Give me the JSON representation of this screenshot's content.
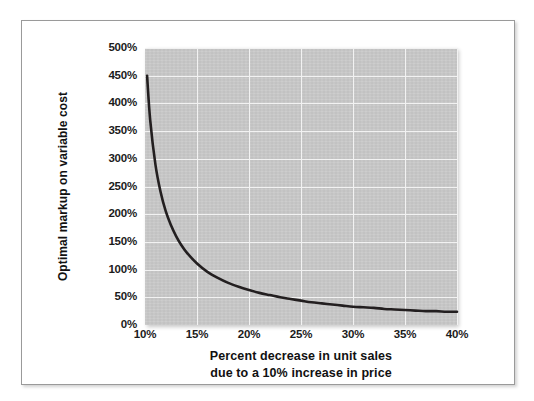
{
  "figure": {
    "frame_border_color": "#9a9a9a",
    "background_color": "#ffffff"
  },
  "chart_data": {
    "type": "line",
    "title": "",
    "subtitle": "",
    "xlabel_lines": [
      "Percent decrease in unit sales",
      "due to a 10% increase in price"
    ],
    "xlabel": "Percent decrease in unit sales due to a 10% increase in price",
    "ylabel": "Optimal markup on variable cost",
    "xlim": [
      10,
      40
    ],
    "ylim": [
      0,
      500
    ],
    "xtick_labels": [
      "10%",
      "15%",
      "20%",
      "25%",
      "30%",
      "35%",
      "40%"
    ],
    "xtick_values": [
      10,
      15,
      20,
      25,
      30,
      35,
      40
    ],
    "ytick_labels": [
      "0%",
      "50%",
      "100%",
      "150%",
      "200%",
      "250%",
      "300%",
      "350%",
      "400%",
      "450%",
      "500%"
    ],
    "ytick_values": [
      0,
      50,
      100,
      150,
      200,
      250,
      300,
      350,
      400,
      450,
      500
    ],
    "grid": true,
    "grid_color": "#f2f2f2",
    "plot_background": "#c9c9c9",
    "legend": null,
    "legend_position": "none",
    "series": [
      {
        "name": "Optimal markup",
        "line_color": "#231f20",
        "line_width": 2.6,
        "x": [
          10.2,
          10.5,
          11,
          11.5,
          12,
          12.5,
          13,
          13.5,
          14,
          15,
          16,
          17,
          18,
          19,
          20,
          21,
          22,
          23,
          24,
          25,
          26,
          27,
          28,
          29,
          30,
          31,
          32,
          33,
          34,
          35,
          36,
          37,
          38,
          39,
          40
        ],
        "values": [
          450,
          370,
          290,
          240,
          205,
          180,
          160,
          144,
          131,
          111,
          96,
          85,
          76,
          69,
          63,
          58,
          54,
          50,
          47,
          44,
          41,
          39,
          37,
          35,
          33,
          32,
          31,
          29,
          28,
          27,
          26,
          25,
          25,
          24,
          24
        ]
      }
    ],
    "annotations": []
  }
}
